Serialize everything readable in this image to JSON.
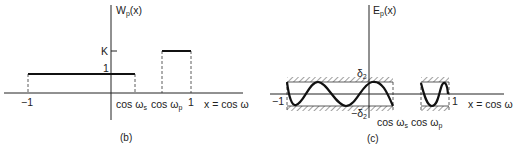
{
  "figure_b": {
    "caption": "(b)",
    "y_axis_label": "W",
    "y_axis_label_sub": "p",
    "y_axis_label_arg": "(x)",
    "tick_K": "K",
    "tick_1": "1",
    "x_tick_neg1": "−1",
    "x_tick_cos_ws": "cos ω",
    "x_tick_cos_ws_sub": "s",
    "x_tick_cos_wp": "cos ω",
    "x_tick_cos_wp_sub": "p",
    "x_tick_1": "1",
    "x_axis_label": "x = cos ω"
  },
  "figure_c": {
    "caption": "(c)",
    "y_axis_label": "E",
    "y_axis_label_sub": "p",
    "y_axis_label_arg": "(x)",
    "tick_delta": "δ",
    "tick_delta_sub": "2",
    "tick_neg_delta": "−δ",
    "tick_neg_delta_sub": "2",
    "x_tick_neg1": "−1",
    "x_tick_1": "1",
    "x_tick_cos_ws": "cos ω",
    "x_tick_cos_ws_sub": "s",
    "x_tick_cos_wp": "cos ω",
    "x_tick_cos_wp_sub": "p",
    "x_axis_label": "x = cos ω"
  },
  "colors": {
    "ink": "#1a1a1a",
    "background": "#ffffff"
  }
}
